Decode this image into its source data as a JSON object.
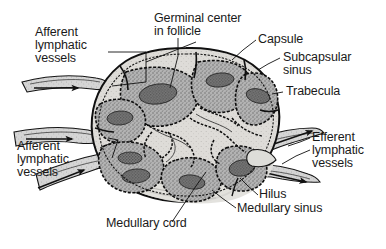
{
  "figure": {
    "background_color": "#ffffff",
    "ink_color": "#111111",
    "tissue_fill": "#a8a8a8",
    "germinal_center_fill": "#6b6b6b",
    "medulla_fill": "#d8d6d2",
    "vessel_fill": "#cfcfcf"
  },
  "labels": {
    "afferent_top": "Afferent\nlymphatic\nvessels",
    "afferent_bottom": "Afferent\nlymphatic\nvessels",
    "germinal_center": "Germinal center\nin follicle",
    "capsule": "Capsule",
    "subcapsular_sinus": "Subcapsular\nsinus",
    "trabecula": "Trabecula",
    "efferent": "Efferent\nlymphatic\nvessels",
    "hilus": "Hilus",
    "medullary_sinus": "Medullary sinus",
    "medullary_cord": "Medullary cord"
  },
  "label_lines": {
    "afferent_top": [
      "Afferent",
      "lymphatic",
      "vessels"
    ],
    "afferent_bottom": [
      "Afferent",
      "lymphatic",
      "vessels"
    ],
    "germinal_center": [
      "Germinal center",
      "in follicle"
    ],
    "subcapsular_sinus": [
      "Subcapsular",
      "sinus"
    ],
    "efferent": [
      "Efferent",
      "lymphatic",
      "vessels"
    ]
  },
  "flow_arrows": {
    "afferent_direction": "into-node",
    "efferent_direction": "out-of-node",
    "afferent_count": 3,
    "efferent_count": 2
  }
}
